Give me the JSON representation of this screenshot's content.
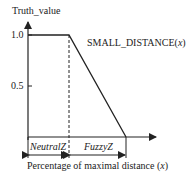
{
  "diagram": {
    "y_axis_label": "Truth_value",
    "y_ticks": [
      "1.0",
      "0.5"
    ],
    "function_label_text": "SMALL_DISTANCE(",
    "function_label_var": "x",
    "function_label_close": ")",
    "region_neutral": "NeutralZ",
    "region_fuzzy": "FuzzyZ",
    "x_axis_label_text": "Percentage of maximal distance (",
    "x_axis_label_var": "x",
    "x_axis_label_close": ")",
    "line_color": "#222222"
  }
}
